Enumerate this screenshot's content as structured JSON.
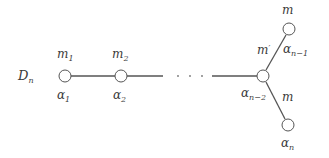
{
  "diagram": {
    "title": {
      "base": "D",
      "sub": "n"
    },
    "nodes": [
      {
        "id": "alpha_1",
        "root": {
          "base": "α",
          "sub": "1"
        },
        "mult": {
          "base": "m",
          "sub": "1"
        },
        "x": 65,
        "y": 76
      },
      {
        "id": "alpha_2",
        "root": {
          "base": "α",
          "sub": "2"
        },
        "mult": {
          "base": "m",
          "sub": "2"
        },
        "x": 121,
        "y": 76
      },
      {
        "id": "alpha_n-2",
        "root": {
          "base": "α",
          "sub": "n−2"
        },
        "mult": {
          "base": "m",
          "sup": "′"
        },
        "x": 263,
        "y": 76
      },
      {
        "id": "alpha_n-1",
        "root": {
          "base": "α",
          "sub": "n−1"
        },
        "mult": {
          "base": "m"
        },
        "x": 289,
        "y": 29
      },
      {
        "id": "alpha_n",
        "root": {
          "base": "α",
          "sub": "n"
        },
        "mult": {
          "base": "m"
        },
        "x": 288,
        "y": 125
      }
    ],
    "ellipsis": "· · ·",
    "colors": {
      "stroke": "#555555",
      "text": "#3a3a3a",
      "background": "#ffffff"
    }
  }
}
